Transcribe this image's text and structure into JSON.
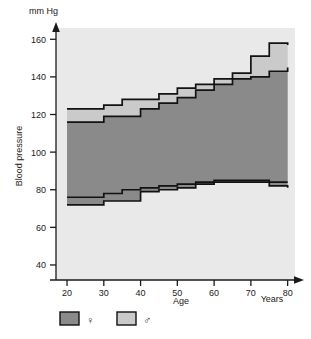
{
  "chart_data": {
    "type": "area",
    "title": "",
    "subtitle": "",
    "xlabel": "Age",
    "ylabel": "Blood pressure",
    "x_unit": "Years",
    "y_unit": "mm Hg",
    "xlim": [
      17,
      82
    ],
    "ylim": [
      32,
      166
    ],
    "x_ticks": [
      20,
      30,
      40,
      50,
      60,
      70,
      80
    ],
    "y_ticks": [
      40,
      60,
      80,
      100,
      120,
      140,
      160
    ],
    "grid": false,
    "step_interval_years": 5,
    "x_steps": [
      20,
      25,
      30,
      35,
      40,
      45,
      50,
      55,
      60,
      65,
      70,
      75,
      80
    ],
    "legend_position": "below-left",
    "series": [
      {
        "name": "female",
        "symbol": "♀",
        "color": "#8a8a8a",
        "systolic": [
          116,
          116,
          119,
          119,
          123,
          126,
          129,
          133,
          136,
          139,
          140,
          143,
          145
        ],
        "diastolic": [
          72,
          72,
          74,
          74,
          79,
          80,
          81,
          83,
          84,
          84,
          84,
          82,
          81
        ]
      },
      {
        "name": "male",
        "symbol": "♂",
        "color": "#cacaca",
        "systolic": [
          123,
          123,
          125,
          128,
          128,
          131,
          134,
          136,
          139,
          142,
          151,
          158,
          157
        ],
        "diastolic": [
          76,
          76,
          78,
          80,
          81,
          82,
          83,
          84,
          85,
          85,
          85,
          84,
          84
        ]
      }
    ]
  },
  "axes": {
    "y_unit_label": "mm Hg",
    "y_title": "Blood pressure",
    "x_title": "Age",
    "x_unit_label": "Years",
    "y_tick_labels": [
      "40",
      "60",
      "80",
      "100",
      "120",
      "140",
      "160"
    ],
    "x_tick_labels": [
      "20",
      "30",
      "40",
      "50",
      "60",
      "70",
      "80"
    ]
  },
  "legend": {
    "items": [
      {
        "label": "♀",
        "name": "female",
        "swatch_color": "#8a8a8a"
      },
      {
        "label": "♂",
        "name": "male",
        "swatch_color": "#cacaca"
      }
    ]
  },
  "colors": {
    "plot_background": "#e9e9e9",
    "page_background": "#ffffff",
    "female_fill": "#8a8a8a",
    "male_fill": "#cacaca",
    "line": "#121212",
    "axis": "#1a1a1a"
  }
}
